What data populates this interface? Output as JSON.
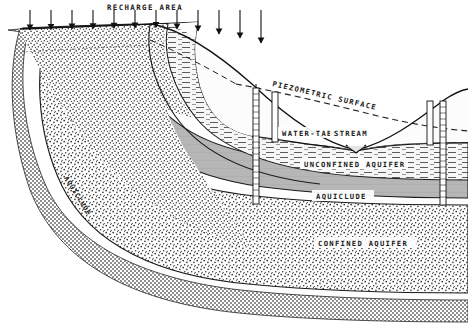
{
  "figure": {
    "type": "geologic-cross-section",
    "width": 468,
    "height": 326,
    "background_color": "#ffffff",
    "line_color": "#1a1a1a"
  },
  "labels": {
    "recharge_area": "RECHARGE AREA",
    "piezometric_surface": "PIEZOMETRIC SURFACE",
    "water_table": "WATER-TABLE",
    "stream": "STREAM",
    "unconfined_aquifer": "UNCONFINED AQUIFER",
    "aquiclude_center": "AQUICLUDE",
    "aquiclude_left": "AQUICLUDE",
    "confined_aquifer": "CONFINED AQUIFER"
  },
  "layers": [
    {
      "name": "upper-unsaturated-sand",
      "label": "",
      "pattern": "stipple-dots",
      "fill_color": "#fdfdfd"
    },
    {
      "name": "unconfined-aquifer",
      "label": "UNCONFINED AQUIFER",
      "pattern": "horizontal-dashes",
      "fill_color": "#f2f2f2"
    },
    {
      "name": "aquiclude",
      "label": "AQUICLUDE",
      "pattern": "solid-gray",
      "fill_color": "#b6b6b6"
    },
    {
      "name": "confined-aquifer",
      "label": "CONFINED AQUIFER",
      "pattern": "stipple-dots",
      "fill_color": "#fdfdfd"
    },
    {
      "name": "bedrock-basement",
      "label": "",
      "pattern": "cross-hatch",
      "fill_color": "#dcdcdc"
    }
  ],
  "recharge": {
    "label": "RECHARGE AREA",
    "arrow_count": 12,
    "arrow_direction": "down"
  },
  "wells": [
    {
      "name": "artesian-well-left-deep",
      "x": 256,
      "depth": "confined-aquifer"
    },
    {
      "name": "observation-well-left-shallow",
      "x": 275,
      "depth": "unconfined-aquifer"
    },
    {
      "name": "observation-well-right-shallow",
      "x": 430,
      "depth": "unconfined-aquifer"
    },
    {
      "name": "artesian-well-right-deep",
      "x": 443,
      "depth": "confined-aquifer"
    }
  ],
  "surfaces": [
    {
      "name": "piezometric-surface",
      "label": "PIEZOMETRIC SURFACE",
      "style": "dashed"
    },
    {
      "name": "water-table",
      "label": "WATER-TABLE",
      "style": "solid"
    },
    {
      "name": "land-surface",
      "label": "",
      "style": "solid"
    }
  ]
}
